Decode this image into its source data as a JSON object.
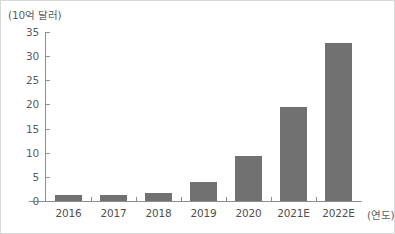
{
  "chart_data": {
    "type": "bar",
    "title": "",
    "categories": [
      "2016",
      "2017",
      "2018",
      "2019",
      "2020",
      "2021E",
      "2022E"
    ],
    "values": [
      1.3,
      1.2,
      1.7,
      3.9,
      9.3,
      19.5,
      32.8
    ],
    "xlabel": "(연도)",
    "ylabel": "(10억 달러)",
    "ylim": [
      0,
      35
    ],
    "yticks": [
      "0",
      "5",
      "10",
      "15",
      "20",
      "25",
      "30",
      "35"
    ],
    "ytick_values": [
      0,
      5,
      10,
      15,
      20,
      25,
      30,
      35
    ],
    "grid": false,
    "legend": null,
    "bar_color": "#717171",
    "axis_color": "#8d8d8d",
    "background_color": "#ffffff"
  }
}
